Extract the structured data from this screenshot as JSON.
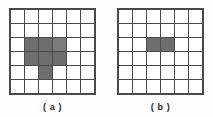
{
  "figure": {
    "background_color": "#fdfdfc",
    "grid_line_color": "#4a4a4a",
    "cell_empty_color": "#ffffff",
    "cell_fill_color": "#6e6e6e"
  },
  "panels": [
    {
      "id": "panel-a",
      "caption": "( a )",
      "grid": {
        "rows": 6,
        "cols": 6,
        "cells": [
          [
            0,
            0,
            0,
            0,
            0,
            0
          ],
          [
            0,
            0,
            0,
            0,
            0,
            0
          ],
          [
            0,
            1,
            1,
            2,
            0,
            0
          ],
          [
            0,
            1,
            1,
            1,
            0,
            0
          ],
          [
            0,
            0,
            1,
            0,
            0,
            0
          ],
          [
            0,
            0,
            0,
            0,
            0,
            0
          ]
        ]
      }
    },
    {
      "id": "panel-b",
      "caption": "( b )",
      "grid": {
        "rows": 6,
        "cols": 6,
        "cells": [
          [
            0,
            0,
            0,
            0,
            0,
            0
          ],
          [
            0,
            0,
            0,
            0,
            0,
            0
          ],
          [
            0,
            0,
            1,
            1,
            0,
            0
          ],
          [
            0,
            0,
            0,
            0,
            0,
            0
          ],
          [
            0,
            0,
            0,
            0,
            0,
            0
          ],
          [
            0,
            0,
            0,
            0,
            0,
            0
          ]
        ]
      }
    }
  ]
}
